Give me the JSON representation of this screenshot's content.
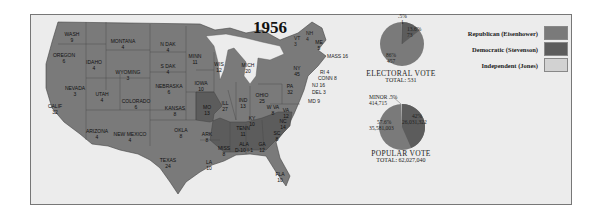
{
  "map": {
    "title": "1956",
    "states": [
      {
        "name": "WASH",
        "votes": "9",
        "party": "R",
        "x": 72,
        "y": 31
      },
      {
        "name": "OREGON",
        "votes": "6",
        "party": "R",
        "x": 64,
        "y": 52
      },
      {
        "name": "CALIF",
        "votes": "32",
        "party": "R",
        "x": 55,
        "y": 103
      },
      {
        "name": "NEVADA",
        "votes": "3",
        "party": "R",
        "x": 75,
        "y": 85
      },
      {
        "name": "IDAHO",
        "votes": "4",
        "party": "R",
        "x": 94,
        "y": 59
      },
      {
        "name": "MONTANA",
        "votes": "4",
        "party": "R",
        "x": 123,
        "y": 38
      },
      {
        "name": "WYOMING",
        "votes": "3",
        "party": "R",
        "x": 128,
        "y": 69
      },
      {
        "name": "UTAH",
        "votes": "4",
        "party": "R",
        "x": 102,
        "y": 91
      },
      {
        "name": "COLORADO",
        "votes": "6",
        "party": "R",
        "x": 136,
        "y": 98
      },
      {
        "name": "ARIZONA",
        "votes": "4",
        "party": "R",
        "x": 97,
        "y": 128
      },
      {
        "name": "NEW MEXICO",
        "votes": "4",
        "party": "R",
        "x": 130,
        "y": 131
      },
      {
        "name": "N DAK",
        "votes": "4",
        "party": "R",
        "x": 168,
        "y": 41
      },
      {
        "name": "S DAK",
        "votes": "4",
        "party": "R",
        "x": 168,
        "y": 63
      },
      {
        "name": "NEBRASKA",
        "votes": "6",
        "party": "R",
        "x": 169,
        "y": 83
      },
      {
        "name": "KANSAS",
        "votes": "8",
        "party": "R",
        "x": 175,
        "y": 105
      },
      {
        "name": "OKLA",
        "votes": "8",
        "party": "R",
        "x": 181,
        "y": 127
      },
      {
        "name": "TEXAS",
        "votes": "24",
        "party": "R",
        "x": 168,
        "y": 157
      },
      {
        "name": "MINN",
        "votes": "11",
        "party": "R",
        "x": 195,
        "y": 53
      },
      {
        "name": "IOWA",
        "votes": "10",
        "party": "R",
        "x": 201,
        "y": 80
      },
      {
        "name": "MO",
        "votes": "13",
        "party": "D",
        "x": 207,
        "y": 104
      },
      {
        "name": "ARK",
        "votes": "8",
        "party": "D",
        "x": 207,
        "y": 131
      },
      {
        "name": "LA",
        "votes": "10",
        "party": "R",
        "x": 209,
        "y": 159
      },
      {
        "name": "WIS",
        "votes": "12",
        "party": "R",
        "x": 219,
        "y": 61
      },
      {
        "name": "ILL",
        "votes": "27",
        "party": "R",
        "x": 225,
        "y": 100
      },
      {
        "name": "MICH",
        "votes": "20",
        "party": "R",
        "x": 248,
        "y": 62
      },
      {
        "name": "IND",
        "votes": "13",
        "party": "R",
        "x": 243,
        "y": 97
      },
      {
        "name": "OHIO",
        "votes": "25",
        "party": "R",
        "x": 262,
        "y": 92
      },
      {
        "name": "KY",
        "votes": "10",
        "party": "R",
        "x": 252,
        "y": 115
      },
      {
        "name": "TENN",
        "votes": "11",
        "party": "R",
        "x": 243,
        "y": 125
      },
      {
        "name": "MISS",
        "votes": "8",
        "party": "D",
        "x": 224,
        "y": 145
      },
      {
        "name": "ALA",
        "votes": "D-10 I-1",
        "party": "D",
        "x": 244,
        "y": 141
      },
      {
        "name": "GA",
        "votes": "12",
        "party": "D",
        "x": 262,
        "y": 141
      },
      {
        "name": "FLA",
        "votes": "10",
        "party": "R",
        "x": 280,
        "y": 171
      },
      {
        "name": "SC",
        "votes": "8",
        "party": "D",
        "x": 277,
        "y": 130
      },
      {
        "name": "NC",
        "votes": "14",
        "party": "D",
        "x": 283,
        "y": 118
      },
      {
        "name": "W VA",
        "votes": "8",
        "party": "R",
        "x": 273,
        "y": 104
      },
      {
        "name": "VA",
        "votes": "12",
        "party": "R",
        "x": 286,
        "y": 107
      },
      {
        "name": "PA",
        "votes": "32",
        "party": "R",
        "x": 290,
        "y": 83
      },
      {
        "name": "NY",
        "votes": "45",
        "party": "R",
        "x": 297,
        "y": 65
      },
      {
        "name": "ME",
        "votes": "5",
        "party": "R",
        "x": 319,
        "y": 39
      }
    ],
    "callouts": [
      {
        "label": "VT",
        "votes": "3",
        "x": 294,
        "y": 35
      },
      {
        "label": "NH",
        "votes": "4",
        "x": 306,
        "y": 30
      },
      {
        "label": "MASS 16",
        "x": 327,
        "y": 53
      },
      {
        "label": "RI 4",
        "x": 320,
        "y": 69
      },
      {
        "label": "CONN 8",
        "x": 318,
        "y": 75
      },
      {
        "label": "NJ 16",
        "x": 312,
        "y": 82
      },
      {
        "label": "DEL 3",
        "x": 312,
        "y": 89
      },
      {
        "label": "MD 9",
        "x": 308,
        "y": 98
      }
    ]
  },
  "electoral_vote": {
    "caption": "ELECTORAL VOTE",
    "total_label": "TOTAL: 531",
    "slices": [
      {
        "party": "Republican",
        "pct": "86%",
        "value": "457"
      },
      {
        "party": "Democratic",
        "pct": "13.6%",
        "value": "73"
      },
      {
        "party": "Independent",
        "pct": ".5%",
        "value": "1"
      }
    ]
  },
  "popular_vote": {
    "caption": "POPULAR VOTE",
    "total_label": "TOTAL: 62,027,040",
    "slices": [
      {
        "party": "Republican",
        "pct": "57.6%",
        "value": "35,581,003"
      },
      {
        "party": "Democratic",
        "pct": "42%",
        "value": "26,031,322"
      },
      {
        "party": "Minor",
        "pct": ".5%",
        "value": "414,715",
        "label": "MINOR"
      }
    ]
  },
  "legend": {
    "items": [
      {
        "label": "Republican (Eisenhower)",
        "color": "#7a7a7a"
      },
      {
        "label": "Democratic (Stevenson)",
        "color": "#5a5a5a"
      },
      {
        "label": "Independent (Jones)",
        "color": "#d2d2d2"
      }
    ]
  },
  "colors": {
    "republican": "#7a7a7a",
    "democratic": "#5c5c5c",
    "independent": "#d2d2d2",
    "background": "#ececec"
  },
  "chart_data": [
    {
      "type": "pie",
      "title": "ELECTORAL VOTE",
      "subtitle": "TOTAL: 531",
      "categories": [
        "Republican (Eisenhower)",
        "Democratic (Stevenson)",
        "Independent (Jones)"
      ],
      "values": [
        457,
        73,
        1
      ],
      "percents": [
        86,
        13.6,
        0.5
      ]
    },
    {
      "type": "pie",
      "title": "POPULAR VOTE",
      "subtitle": "TOTAL: 62,027,040",
      "categories": [
        "Republican (Eisenhower)",
        "Democratic (Stevenson)",
        "Minor"
      ],
      "values": [
        35581003,
        26031322,
        414715
      ],
      "percents": [
        57.6,
        42,
        0.5
      ]
    }
  ]
}
